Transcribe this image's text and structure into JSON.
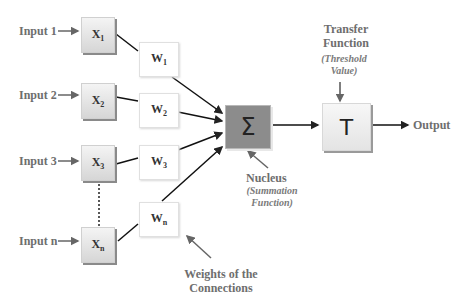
{
  "inputs": [
    {
      "label": "Input 1",
      "x_symbol": "X",
      "x_sub": "1",
      "w_symbol": "W",
      "w_sub": "1"
    },
    {
      "label": "Input 2",
      "x_symbol": "X",
      "x_sub": "2",
      "w_symbol": "W",
      "w_sub": "2"
    },
    {
      "label": "Input 3",
      "x_symbol": "X",
      "x_sub": "3",
      "w_symbol": "W",
      "w_sub": "3"
    },
    {
      "label": "Input n",
      "x_symbol": "X",
      "x_sub": "n",
      "w_symbol": "W",
      "w_sub": "n"
    }
  ],
  "nucleus": {
    "symbol": "Σ",
    "title": "Nucleus",
    "subtitle_line1": "(Summation",
    "subtitle_line2": "Function)",
    "fill_color": "#8c8c8c"
  },
  "transfer": {
    "symbol": "T",
    "title_line1": "Transfer",
    "title_line2": "Function",
    "subtitle_line1": "(Threshold",
    "subtitle_line2": "Value)"
  },
  "output": {
    "label": "Output"
  },
  "weights_caption": {
    "line1": "Weights of the",
    "line2": "Connections"
  }
}
